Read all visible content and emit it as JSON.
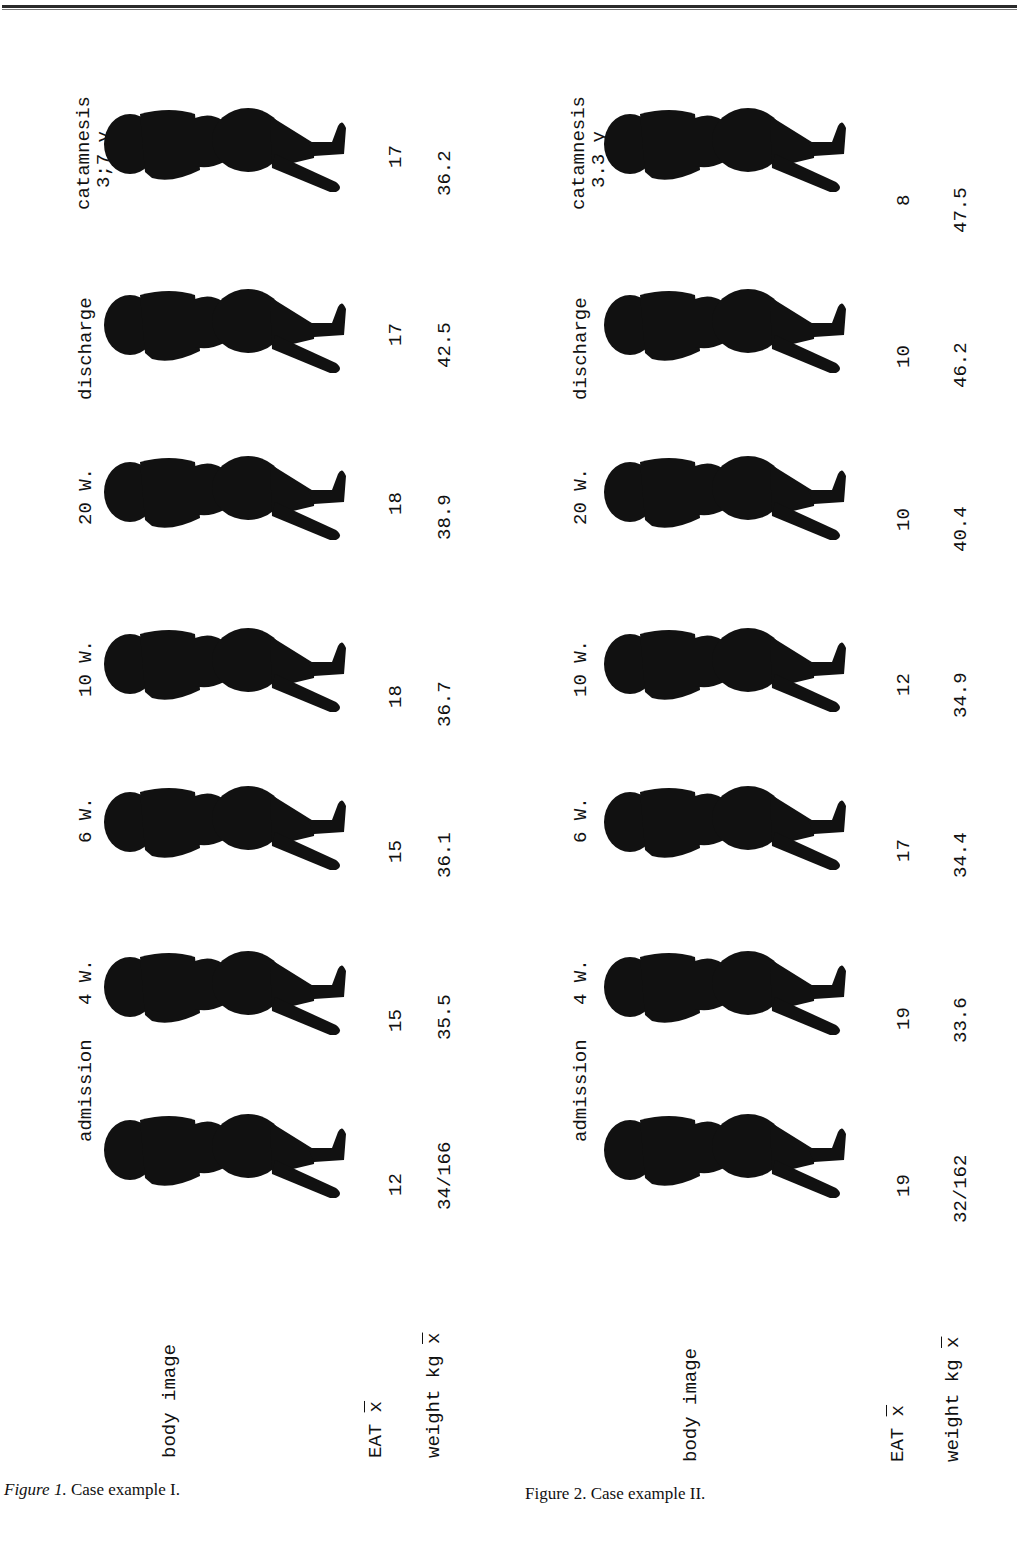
{
  "page": {
    "header_rule": true
  },
  "figures": [
    {
      "id": "fig1",
      "caption_prefix": "Figure 1.",
      "caption_text": " Case example I.",
      "caption_italic_prefix": true,
      "row_labels": {
        "body_image": "body image",
        "eat": "EAT",
        "eat_bar": "x",
        "weight": "weight kg",
        "weight_bar": "x"
      },
      "stages": [
        {
          "label": "catamnesis",
          "sublabel": "3;7 y",
          "eat": "17",
          "weight": "36.2"
        },
        {
          "label": "discharge",
          "sublabel": "",
          "eat": "17",
          "weight": "42.5"
        },
        {
          "label": "20 W.",
          "sublabel": "",
          "eat": "18",
          "weight": "38.9"
        },
        {
          "label": "10 W.",
          "sublabel": "",
          "eat": "18",
          "weight": "36.7"
        },
        {
          "label": "6 W.",
          "sublabel": "",
          "eat": "15",
          "weight": "36.1"
        },
        {
          "label": "4 W.",
          "sublabel": "",
          "eat": "15",
          "weight": "35.5"
        },
        {
          "label": "admission",
          "sublabel": "",
          "eat": "12",
          "weight": "34/166"
        }
      ]
    },
    {
      "id": "fig2",
      "caption_prefix": "Figure 2.",
      "caption_text": " Case example II.",
      "caption_italic_prefix": false,
      "row_labels": {
        "body_image": "body image",
        "eat": "EAT",
        "eat_bar": "x",
        "weight": "weight kg",
        "weight_bar": "x"
      },
      "stages": [
        {
          "label": "catamnesis",
          "sublabel": "3.3 y",
          "eat": "8",
          "weight": "47.5"
        },
        {
          "label": "discharge",
          "sublabel": "",
          "eat": "10",
          "weight": "46.2"
        },
        {
          "label": "20 W.",
          "sublabel": "",
          "eat": "10",
          "weight": "40.4"
        },
        {
          "label": "10 W.",
          "sublabel": "",
          "eat": "12",
          "weight": "34.9"
        },
        {
          "label": "6 W.",
          "sublabel": "",
          "eat": "17",
          "weight": "34.4"
        },
        {
          "label": "4 W.",
          "sublabel": "",
          "eat": "19",
          "weight": "33.6"
        },
        {
          "label": "admission",
          "sublabel": "",
          "eat": "19",
          "weight": "32/162"
        }
      ]
    }
  ],
  "icons": {
    "silhouette": "body-silhouette-icon"
  },
  "colors": {
    "ink": "#111111",
    "paper": "#ffffff",
    "rule": "#2a2a2a"
  }
}
